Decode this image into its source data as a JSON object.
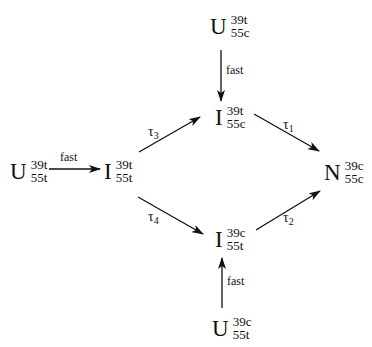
{
  "diagram": {
    "type": "kinetic-scheme",
    "nodes": [
      {
        "id": "u_39t_55c",
        "main": "U",
        "sup": "39t",
        "sub": "55c"
      },
      {
        "id": "u_39t_55t",
        "main": "U",
        "sup": "39t",
        "sub": "55t"
      },
      {
        "id": "i_39t_55t",
        "main": "I",
        "sup": "39t",
        "sub": "55t"
      },
      {
        "id": "i_39t_55c",
        "main": "I",
        "sup": "39t",
        "sub": "55c"
      },
      {
        "id": "n_39c_55c",
        "main": "N",
        "sup": "39c",
        "sub": "55c"
      },
      {
        "id": "i_39c_55t",
        "main": "I",
        "sup": "39c",
        "sub": "55t"
      },
      {
        "id": "u_39c_55t",
        "main": "U",
        "sup": "39c",
        "sub": "55t"
      }
    ],
    "edges": [
      {
        "from": "u_39t_55c",
        "to": "i_39t_55c",
        "label": "fast"
      },
      {
        "from": "u_39t_55t",
        "to": "i_39t_55t",
        "label": "fast"
      },
      {
        "from": "i_39t_55t",
        "to": "i_39t_55c",
        "label_symbol": "τ",
        "label_index": "3"
      },
      {
        "from": "i_39t_55t",
        "to": "i_39c_55t",
        "label_symbol": "τ",
        "label_index": "4"
      },
      {
        "from": "i_39t_55c",
        "to": "n_39c_55c",
        "label_symbol": "τ",
        "label_index": "1"
      },
      {
        "from": "i_39c_55t",
        "to": "n_39c_55c",
        "label_symbol": "τ",
        "label_index": "2"
      },
      {
        "from": "u_39c_55t",
        "to": "i_39c_55t",
        "label": "fast"
      }
    ]
  }
}
